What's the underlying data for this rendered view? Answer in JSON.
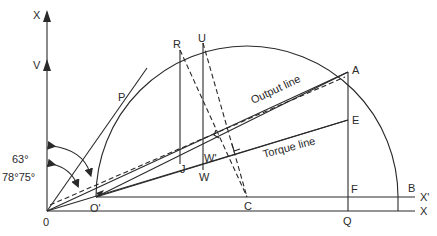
{
  "diagram": {
    "points": {
      "origin": "0",
      "o_prime": "O'",
      "a": "A",
      "b": "B",
      "c": "C",
      "e": "E",
      "f": "F",
      "q": "Q",
      "p": "P",
      "r": "R",
      "u": "U",
      "j": "J",
      "w": "W",
      "w_prime": "W'"
    },
    "axes": {
      "vertical_top": "X",
      "vertical_v": "V",
      "horizontal": "X",
      "horizontal_prime": "X'"
    },
    "lines": {
      "output": "Output line",
      "torque": "Torque line"
    },
    "angles": {
      "angle_1": "63°",
      "angle_2": "78°75°"
    }
  }
}
